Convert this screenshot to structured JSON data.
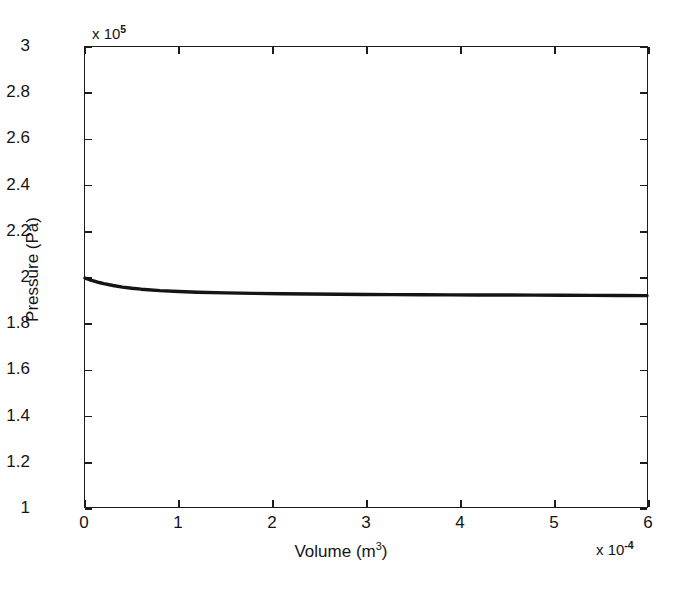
{
  "chart_data": {
    "type": "line",
    "title": "",
    "xlabel": "Volume (m3)",
    "ylabel": "Pressure (Pa)",
    "x_exponent_label": "x 10",
    "x_exponent_value": "-4",
    "y_exponent_label": "x 10",
    "y_exponent_value": "5",
    "xlim": [
      0,
      6
    ],
    "ylim": [
      1,
      3
    ],
    "x_unit_scale": 0.0001,
    "y_unit_scale": 100000.0,
    "grid": false,
    "legend": null,
    "x_ticks": [
      "0",
      "1",
      "2",
      "3",
      "4",
      "5",
      "6"
    ],
    "y_ticks": [
      "3",
      "2.8",
      "2.6",
      "2.4",
      "2.2",
      "2",
      "1.8",
      "1.6",
      "1.4",
      "1.2",
      "1"
    ],
    "x_tick_values": [
      0,
      1,
      2,
      3,
      4,
      5,
      6
    ],
    "y_tick_values": [
      3,
      2.8,
      2.6,
      2.4,
      2.2,
      2,
      1.8,
      1.6,
      1.4,
      1.2,
      1
    ],
    "series": [
      {
        "name": "pressure-volume-curve",
        "color": "#141414",
        "x": [
          0.0,
          0.05,
          0.1,
          0.15,
          0.2,
          0.3,
          0.4,
          0.5,
          0.6,
          0.8,
          1.0,
          1.2,
          1.5,
          1.8,
          2.1,
          2.4,
          2.7,
          3.0,
          3.3,
          3.6,
          3.9,
          4.2,
          4.5,
          4.8,
          5.1,
          5.4,
          5.7,
          6.0
        ],
        "y": [
          1.995,
          1.988,
          1.982,
          1.976,
          1.971,
          1.963,
          1.956,
          1.951,
          1.947,
          1.941,
          1.937,
          1.934,
          1.931,
          1.929,
          1.927,
          1.926,
          1.925,
          1.924,
          1.9235,
          1.923,
          1.9225,
          1.922,
          1.9215,
          1.921,
          1.9205,
          1.92,
          1.9195,
          1.919
        ]
      }
    ]
  },
  "axes": {
    "y_title_text": "Pressure (Pa)",
    "x_title_base": "Volume (m",
    "x_title_sup": "3",
    "x_title_close": ")"
  }
}
